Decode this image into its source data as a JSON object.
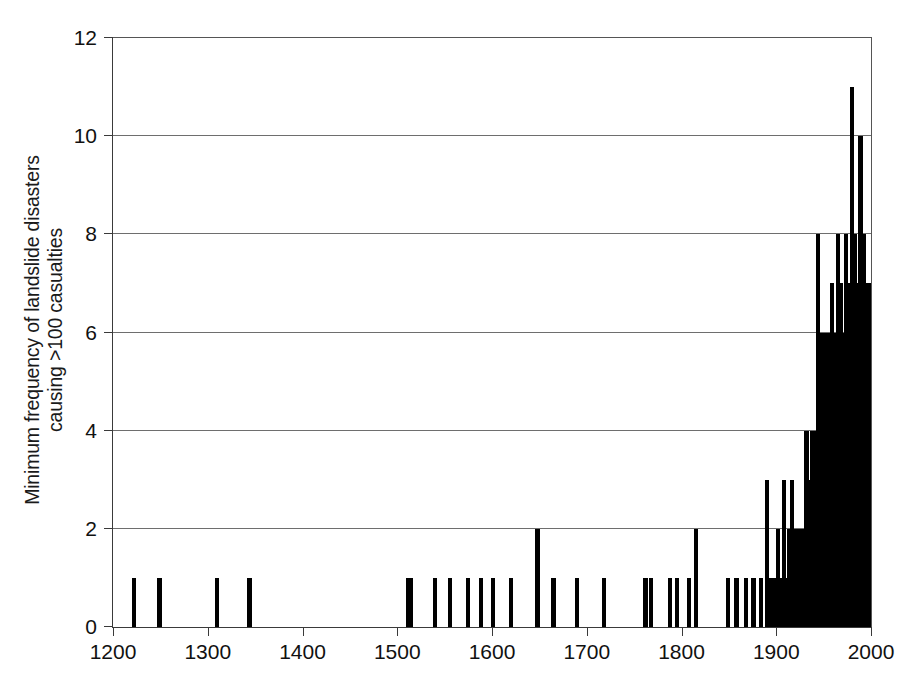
{
  "chart_data": {
    "type": "bar",
    "title": "",
    "subtitle": "",
    "xlabel": "",
    "ylabel": "Minimum frequency of landslide disasters causing >100 casualties",
    "ylabel_line1": "Minimum frequency of landslide disasters",
    "ylabel_line2": "causing >100 casualties",
    "xlim": [
      1200,
      2000
    ],
    "ylim": [
      0,
      12
    ],
    "xticks": [
      1200,
      1300,
      1400,
      1500,
      1600,
      1700,
      1800,
      1900,
      2000
    ],
    "xtick_labels": [
      "1200",
      "1300",
      "1400",
      "1500",
      "1600",
      "1700",
      "1800",
      "1900",
      "2000"
    ],
    "yticks": [
      0,
      2,
      4,
      6,
      8,
      10,
      12
    ],
    "ytick_labels": [
      "0",
      "2",
      "4",
      "6",
      "8",
      "10",
      "12"
    ],
    "grid": "horizontal",
    "legend": "none",
    "bar_color": "#000000",
    "background_color": "#ffffff",
    "axis_color": "#3a3a3a",
    "x": [
      1222,
      1249,
      1310,
      1344,
      1511,
      1514,
      1540,
      1556,
      1575,
      1588,
      1601,
      1620,
      1648,
      1665,
      1690,
      1718,
      1762,
      1768,
      1788,
      1795,
      1808,
      1815,
      1849,
      1858,
      1868,
      1876,
      1884,
      1890,
      1893,
      1896,
      1899,
      1902,
      1905,
      1908,
      1911,
      1914,
      1917,
      1920,
      1923,
      1926,
      1929,
      1932,
      1935,
      1938,
      1941,
      1944,
      1947,
      1950,
      1953,
      1956,
      1959,
      1962,
      1965,
      1968,
      1971,
      1974,
      1977,
      1980,
      1983,
      1986,
      1989,
      1992,
      1995,
      1998
    ],
    "values": [
      1,
      1,
      1,
      1,
      1,
      1,
      1,
      1,
      1,
      1,
      1,
      1,
      2,
      1,
      1,
      1,
      1,
      1,
      1,
      1,
      1,
      2,
      1,
      1,
      1,
      1,
      1,
      3,
      1,
      1,
      1,
      2,
      1,
      3,
      1,
      2,
      3,
      2,
      2,
      2,
      2,
      4,
      3,
      4,
      4,
      8,
      6,
      6,
      6,
      6,
      7,
      6,
      8,
      7,
      6,
      8,
      7,
      11,
      8,
      7,
      10,
      8,
      7,
      7
    ]
  }
}
